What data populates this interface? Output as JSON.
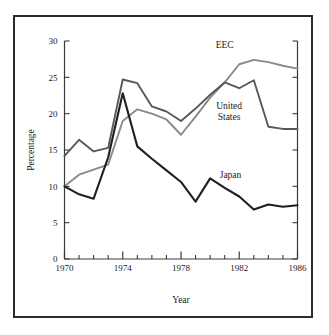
{
  "chart_data": {
    "type": "line",
    "title": "",
    "xlabel": "Year",
    "ylabel": "Percentage",
    "xlim": [
      1970,
      1986
    ],
    "ylim": [
      0,
      30
    ],
    "ytick_values": [
      0,
      5,
      10,
      15,
      20,
      25,
      30
    ],
    "ytick_labels": [
      "0",
      "5",
      "10",
      "15",
      "20",
      "25",
      "30"
    ],
    "xtick_major_values": [
      1970,
      1974,
      1978,
      1982,
      1986
    ],
    "xtick_major_labels": [
      "1970",
      "1974",
      "1978",
      "1982",
      "1986"
    ],
    "xtick_minor_values": [
      1971,
      1972,
      1973,
      1975,
      1976,
      1977,
      1979,
      1980,
      1981,
      1983,
      1984,
      1985
    ],
    "grid": false,
    "legend_position": "inline-annotations",
    "x": [
      1970,
      1971,
      1972,
      1973,
      1974,
      1975,
      1976,
      1977,
      1978,
      1979,
      1980,
      1981,
      1982,
      1983,
      1984,
      1985,
      1986
    ],
    "series": [
      {
        "name": "EEC",
        "color": "#8a8a8a",
        "label_x": 1981.0,
        "label_y": 29.1,
        "values": [
          10.0,
          11.6,
          12.3,
          13.0,
          19.0,
          20.6,
          20.0,
          19.2,
          17.1,
          19.6,
          22.2,
          24.3,
          26.8,
          27.4,
          27.1,
          26.6,
          26.2
        ]
      },
      {
        "name": "United States",
        "color": "#585858",
        "label_x": 1981.3,
        "label_y": 20.7,
        "values": [
          14.2,
          16.4,
          14.8,
          15.3,
          24.7,
          24.2,
          21.0,
          20.3,
          19.0,
          20.7,
          22.6,
          24.3,
          23.5,
          24.6,
          18.2,
          17.9,
          17.9
        ]
      },
      {
        "name": "Japan",
        "color": "#1f1f1f",
        "label_x": 1981.4,
        "label_y": 11.1,
        "values": [
          10.0,
          8.9,
          8.3,
          14.0,
          22.8,
          15.5,
          13.8,
          12.2,
          10.6,
          7.9,
          11.1,
          9.8,
          8.6,
          6.8,
          7.5,
          7.2,
          7.4
        ]
      }
    ]
  }
}
